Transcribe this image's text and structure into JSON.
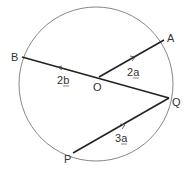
{
  "diagram": {
    "circle": {
      "cx": 96,
      "cy": 84,
      "r": 77,
      "stroke": "#555555"
    },
    "center_label": "O",
    "points": {
      "A": {
        "label": "A",
        "x": 164,
        "y": 40
      },
      "B": {
        "label": "B",
        "x": 22,
        "y": 57
      },
      "Q": {
        "label": "Q",
        "x": 169,
        "y": 98
      },
      "P": {
        "label": "P",
        "x": 73,
        "y": 153
      },
      "O": {
        "label": "O",
        "x": 99,
        "y": 77
      }
    },
    "vectors": {
      "OA": {
        "label_num": "2",
        "label_vec": "a"
      },
      "OB": {
        "label_num": "2",
        "label_vec": "b"
      },
      "PQ": {
        "label_num": "3",
        "label_vec": "a"
      }
    },
    "line_color": "#222222"
  }
}
